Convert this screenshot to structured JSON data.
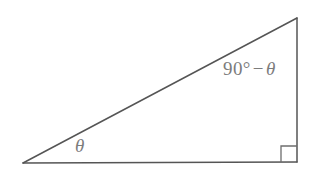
{
  "figure": {
    "kind": "right-triangle-diagram",
    "background_color": "#ffffff",
    "stroke_color": "#555555",
    "label_color": "#7c7c7c",
    "width": 316,
    "height": 172
  },
  "labels": {
    "base_angle": "θ",
    "apex_angle_full": "90° − θ",
    "apex_angle_number": "90",
    "apex_angle_degree_symbol": "°",
    "apex_angle_minus": "−",
    "apex_angle_variable": "θ"
  },
  "geometry": {
    "vertices": {
      "left": {
        "x": 23,
        "y": 163
      },
      "apex": {
        "x": 297,
        "y": 18
      },
      "right_angle": {
        "x": 297,
        "y": 162
      }
    },
    "right_angle_marker": {
      "x": 281,
      "y": 146,
      "size": 16
    },
    "stroke_width": 1.4
  }
}
